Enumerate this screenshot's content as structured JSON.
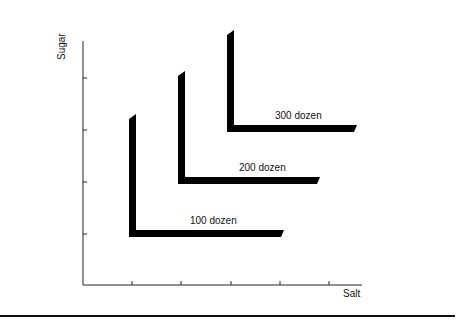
{
  "axes": {
    "y_label": "Sugar",
    "x_label": "Salt",
    "x_ticks": 5,
    "y_ticks": 4
  },
  "isoquants": [
    {
      "label": "100 dozen",
      "corner": [
        132,
        236
      ],
      "top": 115,
      "right": 284
    },
    {
      "label": "200 dozen",
      "corner": [
        181,
        183
      ],
      "top": 72,
      "right": 320
    },
    {
      "label": "300 dozen",
      "corner": [
        230,
        131
      ],
      "top": 31,
      "right": 357
    }
  ],
  "colors": {
    "line": "#000000",
    "axis": "#222222"
  }
}
